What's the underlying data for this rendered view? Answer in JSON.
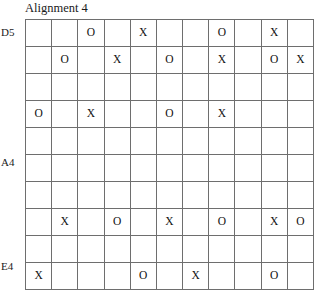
{
  "title": "Alignment 4",
  "grid": {
    "rows": 10,
    "cols": 11,
    "border_color": "#6e6e6e",
    "text_color": "#111111",
    "cells": [
      [
        "",
        "",
        "O",
        "",
        "X",
        "",
        "",
        "O",
        "",
        "X",
        ""
      ],
      [
        "",
        "O",
        "",
        "X",
        "",
        "O",
        "",
        "X",
        "",
        "O",
        "X"
      ],
      [
        "",
        "",
        "",
        "",
        "",
        "",
        "",
        "",
        "",
        "",
        ""
      ],
      [
        "O",
        "",
        "X",
        "",
        "",
        "O",
        "",
        "X",
        "",
        "",
        ""
      ],
      [
        "",
        "",
        "",
        "",
        "",
        "",
        "",
        "",
        "",
        "",
        ""
      ],
      [
        "",
        "",
        "",
        "",
        "",
        "",
        "",
        "",
        "",
        "",
        ""
      ],
      [
        "",
        "",
        "",
        "",
        "",
        "",
        "",
        "",
        "",
        "",
        ""
      ],
      [
        "",
        "X",
        "",
        "O",
        "",
        "X",
        "",
        "O",
        "",
        "X",
        "O"
      ],
      [
        "",
        "",
        "",
        "",
        "",
        "",
        "",
        "",
        "",
        "",
        ""
      ],
      [
        "X",
        "",
        "",
        "",
        "O",
        "",
        "X",
        "",
        "",
        "O",
        ""
      ]
    ]
  },
  "row_labels": [
    {
      "row": 0,
      "label": "D5"
    },
    {
      "row": 5,
      "label": "A4"
    },
    {
      "row": 9,
      "label": "E4"
    }
  ]
}
